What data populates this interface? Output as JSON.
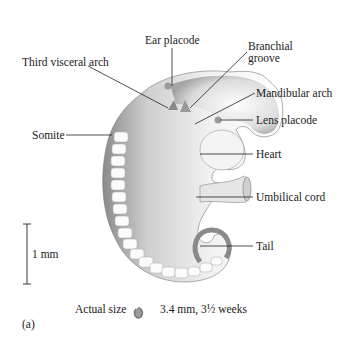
{
  "figure": {
    "panel_label": "(a)",
    "labels": {
      "ear_placode": "Ear placode",
      "branchial_groove_line1": "Branchial",
      "branchial_groove_line2": "groove",
      "third_visceral_arch": "Third visceral arch",
      "mandibular_arch": "Mandibular arch",
      "lens_placode": "Lens placode",
      "somite": "Somite",
      "heart": "Heart",
      "umbilical_cord": "Umbilical cord",
      "tail": "Tail"
    },
    "scale_bar": {
      "label": "1 mm"
    },
    "caption": {
      "actual_size_label": "Actual size",
      "measurement": "3.4 mm, 3½ weeks"
    }
  }
}
